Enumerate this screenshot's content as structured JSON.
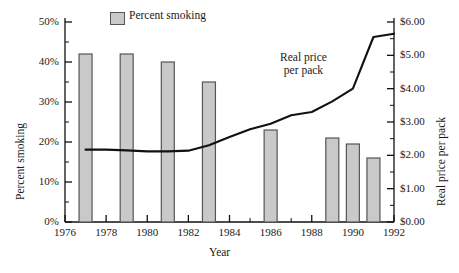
{
  "chart_data": {
    "type": "bar",
    "title": "",
    "xlabel": "Year",
    "ylabel": "Percent smoking",
    "y2label": "Real price per pack",
    "xlim": [
      1976,
      1992
    ],
    "ylim": [
      0,
      50
    ],
    "y2lim": [
      0,
      6
    ],
    "grid": false,
    "legend_position": "top-center",
    "legend": [
      "Percent smoking"
    ],
    "annotations": [
      "Real price per pack"
    ],
    "xticks": [
      1976,
      1978,
      1980,
      1982,
      1984,
      1986,
      1988,
      1990,
      1992
    ],
    "xticklabels": [
      "1976",
      "1978",
      "1980",
      "1982",
      "1984",
      "1986",
      "1988",
      "1990",
      "1992"
    ],
    "xminorticks": [
      1977,
      1979,
      1981,
      1983,
      1985,
      1987,
      1989,
      1991
    ],
    "yticks": [
      0,
      10,
      20,
      30,
      40,
      50
    ],
    "yticklabels": [
      "0%",
      "10%",
      "20%",
      "30%",
      "40%",
      "50%"
    ],
    "yminorticks": [
      5,
      15,
      25,
      35,
      45
    ],
    "y2ticks": [
      0,
      1,
      2,
      3,
      4,
      5,
      6
    ],
    "y2ticklabels": [
      "$0.00",
      "$1.00",
      "$2.00",
      "$3.00",
      "$4.00",
      "$5.00",
      "$6.00"
    ],
    "y2minorticks": [
      0.5,
      1.5,
      2.5,
      3.5,
      4.5,
      5.5
    ],
    "series": [
      {
        "name": "Percent smoking",
        "kind": "bar",
        "axis": "left",
        "color": "#c9c9c9",
        "edgecolor": "#555555",
        "x": [
          1977,
          1979,
          1981,
          1983,
          1986,
          1989,
          1990,
          1991
        ],
        "values": [
          42,
          42,
          40,
          35,
          23,
          21,
          19.5,
          16
        ]
      },
      {
        "name": "Real price per pack",
        "kind": "line",
        "axis": "right",
        "color": "#111111",
        "x": [
          1977,
          1978,
          1979,
          1980,
          1981,
          1982,
          1983,
          1984,
          1985,
          1986,
          1987,
          1988,
          1989,
          1990,
          1991,
          1992
        ],
        "values": [
          2.17,
          2.17,
          2.15,
          2.12,
          2.12,
          2.14,
          2.3,
          2.55,
          2.78,
          2.95,
          3.2,
          3.3,
          3.62,
          4.0,
          5.55,
          5.65
        ]
      }
    ]
  },
  "legend": {
    "percent_smoking_label": "Percent smoking"
  },
  "annotations": {
    "real_price_line1": "Real price",
    "real_price_line2": "per pack"
  },
  "axes": {
    "left_title": "Percent smoking",
    "right_title": "Real price per pack",
    "bottom_title": "Year"
  }
}
